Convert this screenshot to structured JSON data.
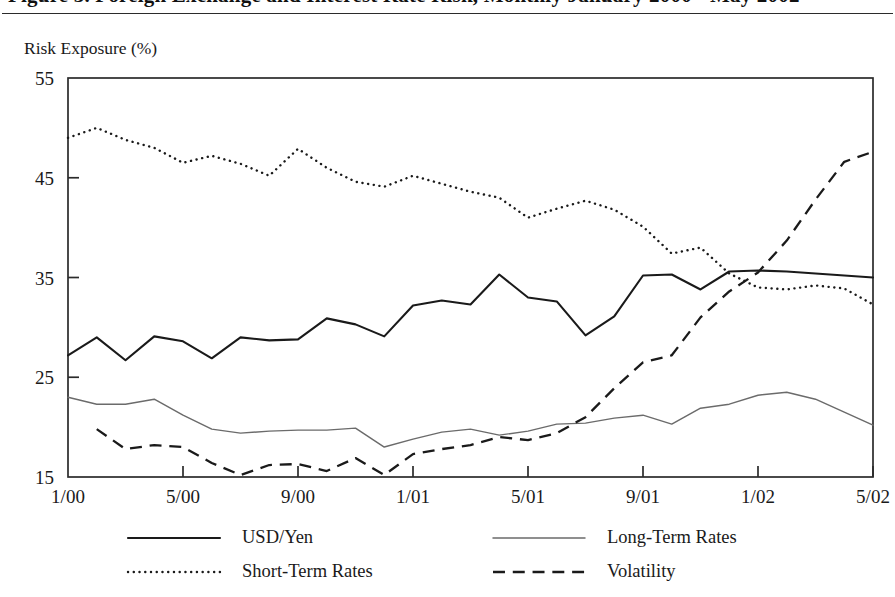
{
  "figure": {
    "title_clipped": "Figure 3. Foreign Exchange and Interest Rate Risk, Monthly January 2000 - May 2002",
    "y_axis_title": "Risk Exposure (%)"
  },
  "chart_data": {
    "type": "line",
    "title": "",
    "xlabel": "",
    "ylabel": "Risk Exposure (%)",
    "ylim": [
      15,
      55
    ],
    "yticks": [
      15,
      25,
      35,
      45,
      55
    ],
    "grid": false,
    "legend_position": "bottom",
    "x": [
      "1/00",
      "2/00",
      "3/00",
      "4/00",
      "5/00",
      "6/00",
      "7/00",
      "8/00",
      "9/00",
      "10/00",
      "11/00",
      "12/00",
      "1/01",
      "2/01",
      "3/01",
      "4/01",
      "5/01",
      "6/01",
      "7/01",
      "8/01",
      "9/01",
      "10/01",
      "11/01",
      "12/01",
      "1/02",
      "2/02",
      "3/02",
      "4/02",
      "5/02"
    ],
    "xtick_labels": [
      "1/00",
      "5/00",
      "9/00",
      "1/01",
      "5/01",
      "9/01",
      "1/02",
      "5/02"
    ],
    "xtick_indices": [
      0,
      4,
      8,
      12,
      16,
      20,
      24,
      28
    ],
    "series": [
      {
        "name": "USD/Yen",
        "style": "solid",
        "color": "#1a1a1a",
        "width": 2.1,
        "values": [
          27.2,
          29.0,
          26.7,
          29.1,
          28.6,
          26.9,
          29.0,
          28.7,
          28.8,
          30.9,
          30.3,
          29.1,
          32.2,
          32.7,
          32.3,
          35.3,
          33.0,
          32.6,
          29.2,
          31.1,
          35.2,
          35.3,
          33.8,
          35.6,
          35.7,
          35.6,
          35.4,
          35.2,
          35.0
        ]
      },
      {
        "name": "Long-Term Rates",
        "style": "solid",
        "color": "#6b6b6b",
        "width": 1.45,
        "values": [
          23.0,
          22.3,
          22.3,
          22.8,
          21.2,
          19.8,
          19.4,
          19.6,
          19.7,
          19.7,
          19.9,
          18.0,
          18.8,
          19.5,
          19.8,
          19.2,
          19.6,
          20.3,
          20.4,
          20.9,
          21.2,
          20.3,
          21.9,
          22.3,
          23.2,
          23.5,
          22.8,
          21.5,
          20.2
        ]
      },
      {
        "name": "Short-Term Rates",
        "style": "dotted",
        "color": "#1a1a1a",
        "width": 2.4,
        "values": [
          49.0,
          50.0,
          48.8,
          48.0,
          46.5,
          47.2,
          46.4,
          45.2,
          47.9,
          46.0,
          44.6,
          44.1,
          45.2,
          44.4,
          43.6,
          43.0,
          41.0,
          41.9,
          42.7,
          41.8,
          40.1,
          37.4,
          38.0,
          35.4,
          34.0,
          33.8,
          34.2,
          33.9,
          32.3
        ]
      },
      {
        "name": "Volatility",
        "style": "dashed",
        "color": "#1a1a1a",
        "width": 2.3,
        "values": [
          null,
          19.8,
          17.8,
          18.2,
          18.0,
          16.4,
          15.2,
          16.2,
          16.3,
          15.6,
          16.9,
          15.2,
          17.3,
          17.8,
          18.2,
          19.0,
          18.7,
          19.4,
          21.0,
          23.9,
          26.5,
          27.2,
          31.0,
          33.6,
          35.5,
          38.7,
          42.8,
          46.6,
          47.6
        ]
      }
    ]
  },
  "legend": {
    "entries": [
      {
        "label": "USD/Yen",
        "style": "solid",
        "color": "#1a1a1a"
      },
      {
        "label": "Long-Term Rates",
        "style": "solid",
        "color": "#6b6b6b"
      },
      {
        "label": "Short-Term Rates",
        "style": "dotted",
        "color": "#1a1a1a"
      },
      {
        "label": "Volatility",
        "style": "dashed",
        "color": "#1a1a1a"
      }
    ]
  }
}
